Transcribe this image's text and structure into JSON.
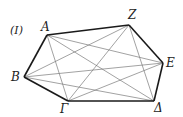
{
  "figure_label": "(I)",
  "vertices": [
    {
      "name": "A",
      "x": 47,
      "y": 35,
      "lx": 41,
      "ly": 31
    },
    {
      "name": "Z",
      "x": 129,
      "y": 25,
      "lx": 128,
      "ly": 19
    },
    {
      "name": "E",
      "x": 163,
      "y": 63,
      "lx": 166,
      "ly": 67
    },
    {
      "name": "Δ",
      "x": 154,
      "y": 101,
      "lx": 154,
      "ly": 112
    },
    {
      "name": "Γ",
      "x": 68,
      "y": 101,
      "lx": 60,
      "ly": 113
    },
    {
      "name": "B",
      "x": 24,
      "y": 77,
      "lx": 11,
      "ly": 81
    }
  ],
  "polygon_order": [
    "A",
    "Z",
    "E",
    "Δ",
    "Γ",
    "B"
  ],
  "diagonals": [
    [
      "A",
      "E"
    ],
    [
      "A",
      "Δ"
    ],
    [
      "A",
      "Γ"
    ],
    [
      "Z",
      "Δ"
    ],
    [
      "Z",
      "Γ"
    ],
    [
      "Z",
      "B"
    ],
    [
      "E",
      "Γ"
    ],
    [
      "E",
      "B"
    ],
    [
      "Δ",
      "B"
    ]
  ],
  "colors": {
    "edge": "#1a1a1a",
    "diagonal": "#7a7a7a"
  }
}
